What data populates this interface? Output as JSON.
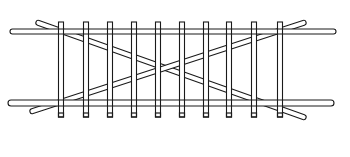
{
  "diagram": {
    "title": "Timber ladder frame with cross bracing",
    "colors": {
      "background": "#ffffff",
      "line": "#1a1a1a"
    },
    "rails": [
      {
        "name": "top-rail",
        "x1": 10,
        "x2": 336,
        "y": 29,
        "thickness": 5
      },
      {
        "name": "bottom-rail",
        "x1": 8,
        "x2": 334,
        "y": 100,
        "thickness": 6
      }
    ],
    "rungs": {
      "count": 10,
      "x": [
        61,
        86,
        110,
        134,
        158,
        182,
        206,
        229,
        254,
        280
      ],
      "y_top": 22,
      "y_bottom": 117,
      "width": 5
    },
    "braces": [
      {
        "name": "brace-descending",
        "x1": 36,
        "y1": 22,
        "x2": 306,
        "y2": 118
      },
      {
        "name": "brace-ascending",
        "x1": 30,
        "y1": 112,
        "x2": 306,
        "y2": 22
      }
    ]
  }
}
